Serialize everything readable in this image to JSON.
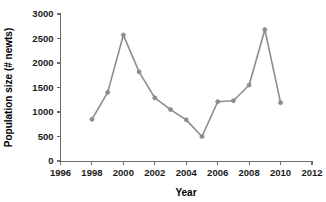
{
  "chart_data": {
    "type": "line",
    "title": "",
    "xlabel": "Year",
    "ylabel": "Population size (# newts)",
    "xlim": [
      1996,
      2012
    ],
    "ylim": [
      0,
      3000
    ],
    "xticks": [
      1996,
      1998,
      2000,
      2002,
      2004,
      2006,
      2008,
      2010,
      2012
    ],
    "yticks": [
      0,
      500,
      1000,
      1500,
      2000,
      2500,
      3000
    ],
    "grid": false,
    "legend": "none",
    "series": [
      {
        "name": "Newt population",
        "color": "#8c8c8c",
        "marker": "circle",
        "x": [
          1998,
          1999,
          2000,
          2001,
          2002,
          2003,
          2004,
          2005,
          2006,
          2007,
          2008,
          2009,
          2010
        ],
        "values": [
          850,
          1400,
          2570,
          1820,
          1290,
          1050,
          840,
          500,
          1210,
          1230,
          1550,
          2680,
          1190
        ]
      }
    ]
  },
  "axes": {
    "x_title": "Year",
    "y_title": "Population size (# newts)"
  }
}
